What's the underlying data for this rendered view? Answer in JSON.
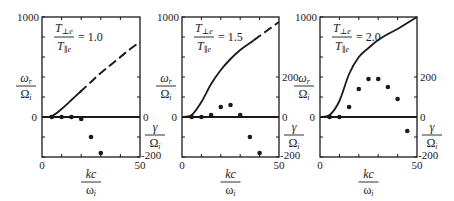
{
  "chart_data": [
    {
      "type": "line",
      "panel_label": "T⊥e/T∥e = 1.0",
      "ratio_value": "1.0",
      "xlabel": "kc/ωi",
      "ylabel_left": "ωr/Ωi",
      "ylabel_right": "γ/Ωi",
      "xlim": [
        0,
        50
      ],
      "ylim_left": [
        -400,
        1000
      ],
      "ylim_right": [
        -200,
        0
      ],
      "x_ticks": [
        "0",
        "50"
      ],
      "y_left_ticks": [
        "0",
        "1000"
      ],
      "y_right_ticks": [
        "0",
        "-200"
      ],
      "series": [
        {
          "name": "ωr/Ωi",
          "style": "solid-then-dashed",
          "x": [
            0,
            5,
            10,
            15,
            20,
            25,
            30,
            35,
            40,
            45,
            50
          ],
          "values": [
            0,
            10,
            80,
            170,
            260,
            350,
            440,
            520,
            600,
            680,
            750
          ],
          "dashed_from_x": 20
        },
        {
          "name": "γ/Ωi",
          "style": "points",
          "x": [
            5,
            10,
            15,
            20,
            25,
            30
          ],
          "values": [
            0,
            0,
            0,
            -10,
            -100,
            -180
          ]
        }
      ]
    },
    {
      "type": "line",
      "panel_label": "T⊥e/T∥e = 1.5",
      "ratio_value": "1.5",
      "xlabel": "kc/ωi",
      "ylabel_left": "ωr/Ωi",
      "ylabel_right": "γ/Ωi",
      "xlim": [
        0,
        50
      ],
      "ylim_left": [
        -400,
        1000
      ],
      "ylim_right": [
        -200,
        200
      ],
      "x_ticks": [
        "0",
        "50"
      ],
      "y_left_ticks": [
        "0",
        "1000"
      ],
      "y_right_ticks": [
        "200",
        "0",
        "-200"
      ],
      "series": [
        {
          "name": "ωr/Ωi",
          "style": "solid-then-dashed",
          "x": [
            0,
            5,
            10,
            15,
            20,
            25,
            30,
            35,
            40,
            45,
            50
          ],
          "values": [
            0,
            20,
            150,
            330,
            470,
            580,
            670,
            740,
            810,
            880,
            950
          ],
          "dashed_from_x": 37
        },
        {
          "name": "γ/Ωi",
          "style": "points",
          "x": [
            5,
            10,
            15,
            20,
            25,
            30,
            35,
            40
          ],
          "values": [
            0,
            0,
            10,
            50,
            60,
            10,
            -100,
            -180
          ]
        }
      ]
    },
    {
      "type": "line",
      "panel_label": "T⊥e/T∥e = 2.0",
      "ratio_value": "2.0",
      "xlabel": "kc/ωi",
      "ylabel_left": "ωr/Ωi",
      "ylabel_right": "γ/Ωi",
      "xlim": [
        0,
        50
      ],
      "ylim_left": [
        -400,
        1000
      ],
      "ylim_right": [
        -200,
        200
      ],
      "x_ticks": [
        "0",
        "50"
      ],
      "y_left_ticks": [
        "0",
        "1000"
      ],
      "y_right_ticks": [
        "200",
        "0",
        "-200"
      ],
      "series": [
        {
          "name": "ωr/Ωi",
          "style": "solid",
          "x": [
            0,
            5,
            10,
            15,
            20,
            25,
            30,
            35,
            40,
            45,
            50
          ],
          "values": [
            0,
            20,
            160,
            430,
            600,
            690,
            770,
            830,
            880,
            940,
            1000
          ]
        },
        {
          "name": "γ/Ωi",
          "style": "points",
          "x": [
            5,
            10,
            15,
            20,
            25,
            30,
            35,
            40,
            45
          ],
          "values": [
            0,
            0,
            50,
            140,
            190,
            190,
            150,
            90,
            -70
          ]
        }
      ]
    }
  ],
  "labels": {
    "omega_r": "ωr",
    "Omega_i": "Ωi",
    "gamma": "γ",
    "kc": "kc",
    "omega_i": "ωi",
    "T_perp": "T⊥e",
    "T_par": "T∥e",
    "eq": "="
  }
}
